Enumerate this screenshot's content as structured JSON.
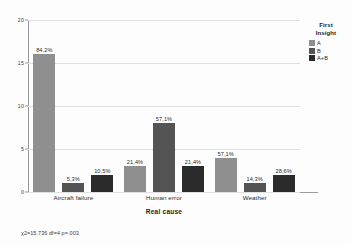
{
  "chart_data": {
    "type": "bar",
    "title": "",
    "xlabel": "Real cause",
    "ylabel": "",
    "ylim": [
      0,
      20
    ],
    "yticks": [
      0,
      5,
      10,
      15,
      20
    ],
    "ytick_labels": [
      "0",
      "5",
      "10",
      "15",
      "20"
    ],
    "grid": true,
    "legend_position": "right",
    "categories": [
      "Aircraft failure",
      "Human error",
      "Weather"
    ],
    "series": [
      {
        "name": "A",
        "color": "#8f8f8f",
        "values": [
          16,
          3,
          4
        ],
        "data_labels": [
          "84,2%",
          "21,4%",
          "57,1%"
        ]
      },
      {
        "name": "B",
        "color": "#545454",
        "values": [
          1,
          8,
          1
        ],
        "data_labels": [
          "5,3%",
          "57,1%",
          "14,3%"
        ]
      },
      {
        "name": "A+B",
        "color": "#2b2b2b",
        "values": [
          2,
          3,
          2
        ],
        "data_labels": [
          "10,5%",
          "21,4%",
          "28,6%"
        ]
      }
    ],
    "annotations": [
      "χ2=15.736 df=4 p=.003"
    ]
  },
  "legend": {
    "title_line1": "First",
    "title_line2": "Insight"
  },
  "footnote": "χ2=15.736 df=4 p=.003"
}
